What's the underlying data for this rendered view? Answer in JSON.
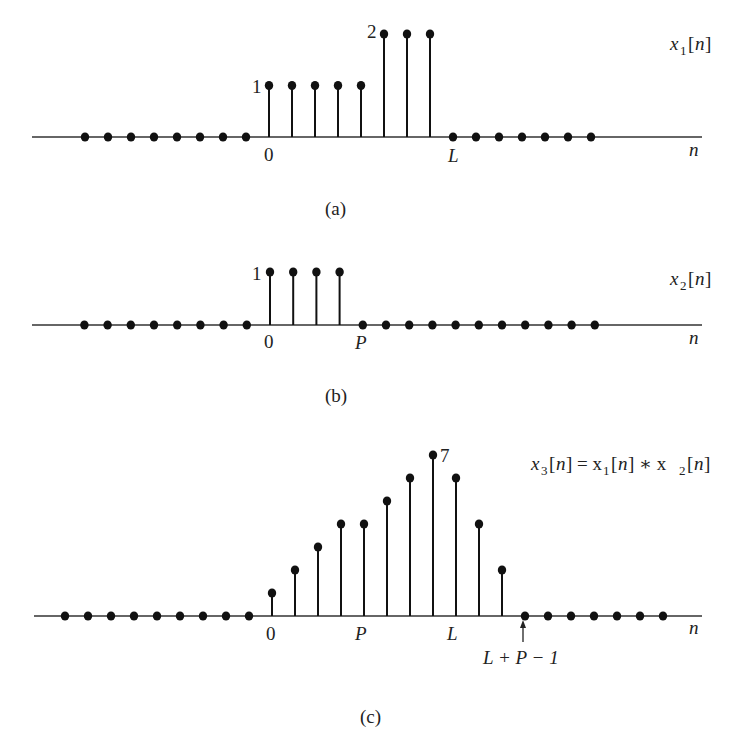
{
  "chart_data": [
    {
      "type": "stem",
      "id": "a",
      "caption": "(a)",
      "title": "x1[n]",
      "xlabel": "n",
      "n": [
        -8,
        -7,
        -6,
        -5,
        -4,
        -3,
        -2,
        -1,
        0,
        1,
        2,
        3,
        4,
        5,
        6,
        7,
        8,
        9,
        10,
        11,
        12,
        13,
        14
      ],
      "values": [
        0,
        0,
        0,
        0,
        0,
        0,
        0,
        0,
        1,
        1,
        1,
        1,
        1,
        2,
        2,
        2,
        0,
        0,
        0,
        0,
        0,
        0,
        0
      ],
      "tick_labels": [
        {
          "n": 0,
          "label": "0"
        },
        {
          "n": 8,
          "label": "L"
        }
      ],
      "value_labels": [
        {
          "n": 0,
          "label": "1"
        },
        {
          "n": 5,
          "label": "2"
        }
      ],
      "params": {
        "L": 8
      }
    },
    {
      "type": "stem",
      "id": "b",
      "caption": "(b)",
      "title": "x2[n]",
      "xlabel": "n",
      "n": [
        -8,
        -7,
        -6,
        -5,
        -4,
        -3,
        -2,
        -1,
        0,
        1,
        2,
        3,
        4,
        5,
        6,
        7,
        8,
        9,
        10,
        11,
        12,
        13,
        14
      ],
      "values": [
        0,
        0,
        0,
        0,
        0,
        0,
        0,
        0,
        1,
        1,
        1,
        1,
        0,
        0,
        0,
        0,
        0,
        0,
        0,
        0,
        0,
        0,
        0
      ],
      "tick_labels": [
        {
          "n": 0,
          "label": "0"
        },
        {
          "n": 4,
          "label": "P"
        }
      ],
      "value_labels": [
        {
          "n": 0,
          "label": "1"
        }
      ],
      "params": {
        "P": 4
      }
    },
    {
      "type": "stem",
      "id": "c",
      "caption": "(c)",
      "title": "x3[n] = x1[n] * x2[n]",
      "xlabel": "n",
      "n": [
        -9,
        -8,
        -7,
        -6,
        -5,
        -4,
        -3,
        -2,
        -1,
        0,
        1,
        2,
        3,
        4,
        5,
        6,
        7,
        8,
        9,
        10,
        11,
        12,
        13,
        14,
        15,
        16,
        17
      ],
      "values": [
        0,
        0,
        0,
        0,
        0,
        0,
        0,
        0,
        0,
        1,
        2,
        3,
        4,
        4,
        5,
        6,
        7,
        6,
        4,
        2,
        0,
        0,
        0,
        0,
        0,
        0,
        0
      ],
      "tick_labels": [
        {
          "n": 0,
          "label": "0"
        },
        {
          "n": 4,
          "label": "P"
        },
        {
          "n": 8,
          "label": "L"
        }
      ],
      "annotations": [
        {
          "n": 11,
          "label": "L + P − 1",
          "arrow": true
        }
      ],
      "value_labels": [
        {
          "n": 7,
          "label": "7"
        }
      ],
      "params": {
        "L": 8,
        "P": 4,
        "length": "L + P − 1"
      }
    }
  ],
  "labels": {
    "a": {
      "caption": "(a)",
      "n_axis": "n",
      "tick0": "0",
      "tickL": "L",
      "val1": "1",
      "val2": "2",
      "title_main": "x",
      "title_sub": "1",
      "title_arg": "[",
      "title_n": "n",
      "title_close": "]"
    },
    "b": {
      "caption": "(b)",
      "n_axis": "n",
      "tick0": "0",
      "tickP": "P",
      "val1": "1",
      "title_main": "x",
      "title_sub": "2",
      "title_arg": "[",
      "title_n": "n",
      "title_close": "]"
    },
    "c": {
      "caption": "(c)",
      "n_axis": "n",
      "tick0": "0",
      "tickP": "P",
      "tickL": "L",
      "tickLP1": "L + P − 1",
      "val7": "7",
      "eq": {
        "x3": "x",
        "s3": "3",
        "eqsign": "] = x",
        "s1": "1",
        "star": "] ∗ x",
        "s2": "2",
        "open": "[",
        "n": "n",
        "close": "]"
      }
    }
  }
}
